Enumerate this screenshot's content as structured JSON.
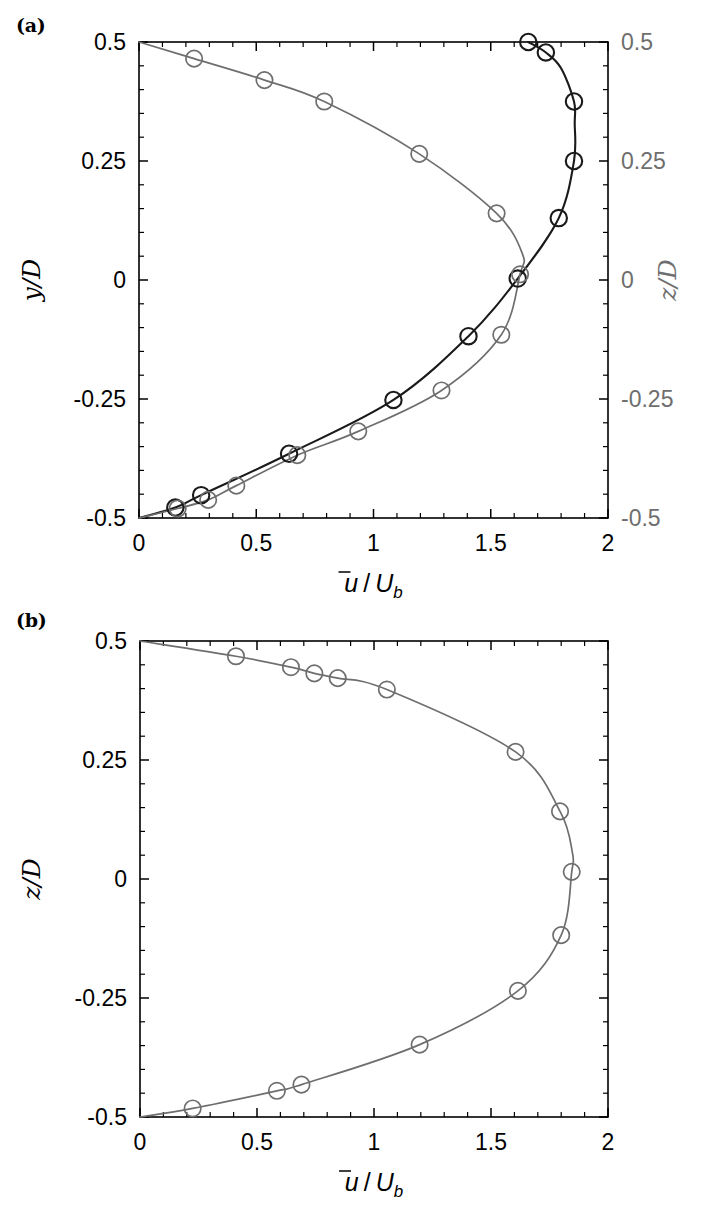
{
  "figure": {
    "width": 715,
    "height": 1226,
    "background": "#ffffff",
    "colors": {
      "black": "#1a1a1a",
      "gray": "#6e6e6e",
      "axis": "#000000"
    }
  },
  "panels": [
    {
      "tag": "(a)",
      "id": "panel-a",
      "xlabel": "ū/U_b",
      "xlabel_parts": {
        "numerator": "u",
        "overbar": true,
        "slash": "/",
        "denominator": "U",
        "subscript": "b"
      },
      "left_axis_title": "y/D",
      "right_axis_title": "z/D",
      "xticks": [
        0,
        0.5,
        1,
        1.5,
        2
      ],
      "xtick_labels": [
        "0",
        "0.5",
        "1",
        "1.5",
        "2"
      ],
      "yticks": [
        -0.5,
        -0.25,
        0,
        0.25,
        0.5
      ],
      "ytick_labels": [
        "-0.5",
        "-0.25",
        "0",
        "0.25",
        "0.5"
      ],
      "right_ytick_labels": [
        "-0.5",
        "-0.25",
        "0",
        "0.25",
        "0.5"
      ],
      "xlim": [
        0,
        2
      ],
      "ylim": [
        -0.5,
        0.5
      ],
      "x_minor_per_major": 5,
      "y_minor_per_major": 5
    },
    {
      "tag": "(b)",
      "id": "panel-b",
      "xlabel": "ū/U_b",
      "xlabel_parts": {
        "numerator": "u",
        "overbar": true,
        "slash": "/",
        "denominator": "U",
        "subscript": "b"
      },
      "left_axis_title": "z/D",
      "right_axis_title": "",
      "xticks": [
        0,
        0.5,
        1,
        1.5,
        2
      ],
      "xtick_labels": [
        "0",
        "0.5",
        "1",
        "1.5",
        "2"
      ],
      "yticks": [
        -0.5,
        -0.25,
        0,
        0.25,
        0.5
      ],
      "ytick_labels": [
        "-0.5",
        "-0.25",
        "0",
        "0.25",
        "0.5"
      ],
      "right_ytick_labels": [],
      "xlim": [
        0,
        2
      ],
      "ylim": [
        -0.5,
        0.5
      ],
      "x_minor_per_major": 5,
      "y_minor_per_major": 5
    }
  ],
  "chart_data": [
    {
      "type": "line",
      "panel": "(a)",
      "title": "",
      "xlabel": "ū/U_b",
      "ylabel": "y/D",
      "ylabel_right": "z/D",
      "xlim": [
        0,
        2
      ],
      "ylim": [
        -0.5,
        0.5
      ],
      "grid": false,
      "legend": "none",
      "orientation": "vertical-profile",
      "note": "x is velocity ratio, y is wall-normal coordinate; two profiles plotted: black (y/D, spanwise-like direction) and gray (z/D)",
      "series": [
        {
          "name": "y/D profile",
          "color": "#1a1a1a",
          "marker": "open-circle",
          "line_width": 2.1,
          "points": [
            {
              "x": 0.0,
              "y": -0.5
            },
            {
              "x": 0.155,
              "y": -0.478
            },
            {
              "x": 0.265,
              "y": -0.452
            },
            {
              "x": 0.64,
              "y": -0.365
            },
            {
              "x": 1.085,
              "y": -0.252
            },
            {
              "x": 1.405,
              "y": -0.118
            },
            {
              "x": 1.615,
              "y": 0.003
            },
            {
              "x": 1.79,
              "y": 0.13
            },
            {
              "x": 1.855,
              "y": 0.25
            },
            {
              "x": 1.855,
              "y": 0.375
            },
            {
              "x": 1.735,
              "y": 0.478
            },
            {
              "x": 1.66,
              "y": 0.5
            }
          ],
          "curve_path": [
            {
              "x": 0.0,
              "y": -0.5
            },
            {
              "x": 0.155,
              "y": -0.478
            },
            {
              "x": 0.265,
              "y": -0.452
            },
            {
              "x": 0.64,
              "y": -0.365
            },
            {
              "x": 1.085,
              "y": -0.252
            },
            {
              "x": 1.405,
              "y": -0.118
            },
            {
              "x": 1.615,
              "y": 0.003
            },
            {
              "x": 1.79,
              "y": 0.13
            },
            {
              "x": 1.855,
              "y": 0.25
            },
            {
              "x": 1.858,
              "y": 0.33
            },
            {
              "x": 1.855,
              "y": 0.375
            },
            {
              "x": 1.8,
              "y": 0.445
            },
            {
              "x": 1.735,
              "y": 0.478
            },
            {
              "x": 1.66,
              "y": 0.5
            }
          ]
        },
        {
          "name": "z/D profile",
          "color": "#6e6e6e",
          "marker": "open-circle",
          "line_width": 1.7,
          "points": [
            {
              "x": 0.0,
              "y": -0.5
            },
            {
              "x": 0.165,
              "y": -0.48
            },
            {
              "x": 0.295,
              "y": -0.462
            },
            {
              "x": 0.415,
              "y": -0.432
            },
            {
              "x": 0.675,
              "y": -0.368
            },
            {
              "x": 0.935,
              "y": -0.318
            },
            {
              "x": 1.29,
              "y": -0.232
            },
            {
              "x": 1.545,
              "y": -0.115
            },
            {
              "x": 1.625,
              "y": 0.012
            },
            {
              "x": 1.525,
              "y": 0.14
            },
            {
              "x": 1.195,
              "y": 0.265
            },
            {
              "x": 0.79,
              "y": 0.375
            },
            {
              "x": 0.535,
              "y": 0.42
            },
            {
              "x": 0.235,
              "y": 0.465
            },
            {
              "x": 0.0,
              "y": 0.5
            }
          ],
          "curve_path": [
            {
              "x": 0.0,
              "y": -0.5
            },
            {
              "x": 0.165,
              "y": -0.48
            },
            {
              "x": 0.295,
              "y": -0.462
            },
            {
              "x": 0.415,
              "y": -0.432
            },
            {
              "x": 0.675,
              "y": -0.368
            },
            {
              "x": 0.935,
              "y": -0.318
            },
            {
              "x": 1.29,
              "y": -0.232
            },
            {
              "x": 1.545,
              "y": -0.115
            },
            {
              "x": 1.625,
              "y": 0.012
            },
            {
              "x": 1.635,
              "y": 0.055
            },
            {
              "x": 1.525,
              "y": 0.14
            },
            {
              "x": 1.195,
              "y": 0.265
            },
            {
              "x": 0.79,
              "y": 0.375
            },
            {
              "x": 0.535,
              "y": 0.42
            },
            {
              "x": 0.235,
              "y": 0.465
            },
            {
              "x": 0.0,
              "y": 0.5
            }
          ]
        }
      ]
    },
    {
      "type": "line",
      "panel": "(b)",
      "title": "",
      "xlabel": "ū/U_b",
      "ylabel": "z/D",
      "xlim": [
        0,
        2
      ],
      "ylim": [
        -0.5,
        0.5
      ],
      "grid": false,
      "legend": "none",
      "orientation": "vertical-profile",
      "series": [
        {
          "name": "z/D profile",
          "color": "#6e6e6e",
          "marker": "open-circle",
          "line_width": 1.7,
          "points": [
            {
              "x": 0.0,
              "y": -0.5
            },
            {
              "x": 0.225,
              "y": -0.482
            },
            {
              "x": 0.585,
              "y": -0.445
            },
            {
              "x": 0.69,
              "y": -0.432
            },
            {
              "x": 1.195,
              "y": -0.348
            },
            {
              "x": 1.615,
              "y": -0.235
            },
            {
              "x": 1.8,
              "y": -0.118
            },
            {
              "x": 1.845,
              "y": 0.015
            },
            {
              "x": 1.795,
              "y": 0.142
            },
            {
              "x": 1.605,
              "y": 0.267
            },
            {
              "x": 1.055,
              "y": 0.398
            },
            {
              "x": 0.845,
              "y": 0.422
            },
            {
              "x": 0.745,
              "y": 0.432
            },
            {
              "x": 0.645,
              "y": 0.445
            },
            {
              "x": 0.41,
              "y": 0.468
            },
            {
              "x": 0.0,
              "y": 0.5
            }
          ],
          "curve_path": [
            {
              "x": 0.0,
              "y": -0.5
            },
            {
              "x": 0.225,
              "y": -0.482
            },
            {
              "x": 0.585,
              "y": -0.445
            },
            {
              "x": 0.69,
              "y": -0.432
            },
            {
              "x": 1.195,
              "y": -0.348
            },
            {
              "x": 1.615,
              "y": -0.235
            },
            {
              "x": 1.8,
              "y": -0.118
            },
            {
              "x": 1.845,
              "y": 0.015
            },
            {
              "x": 1.848,
              "y": 0.055
            },
            {
              "x": 1.795,
              "y": 0.142
            },
            {
              "x": 1.605,
              "y": 0.267
            },
            {
              "x": 1.055,
              "y": 0.398
            },
            {
              "x": 0.845,
              "y": 0.422
            },
            {
              "x": 0.745,
              "y": 0.432
            },
            {
              "x": 0.645,
              "y": 0.445
            },
            {
              "x": 0.41,
              "y": 0.468
            },
            {
              "x": 0.0,
              "y": 0.5
            }
          ]
        }
      ]
    }
  ]
}
